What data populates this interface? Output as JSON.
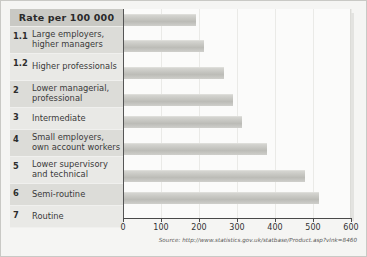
{
  "header": {
    "title": "Rate per 100 000"
  },
  "source": {
    "text": "Source: http://www.statistics.gov.uk/statbase/Product.asp?vlnk=8460"
  },
  "rows": [
    {
      "num": "1.1",
      "label": "Large employers, higher managers"
    },
    {
      "num": "1.2",
      "label": "Higher professionals"
    },
    {
      "num": "2",
      "label": "Lower managerial, professional"
    },
    {
      "num": "3",
      "label": "Intermediate"
    },
    {
      "num": "4",
      "label": "Small employers, own account workers"
    },
    {
      "num": "5",
      "label": "Lower supervisory and technical"
    },
    {
      "num": "6",
      "label": "Semi-routine"
    },
    {
      "num": "7",
      "label": "Routine"
    }
  ],
  "axis": {
    "ticks": [
      "0",
      "100",
      "200",
      "300",
      "400",
      "500",
      "600"
    ]
  },
  "colors": {
    "bar": "#c2c2bd",
    "header_band": "#c9c9c4",
    "row_odd": "#dcdcd8",
    "row_even": "#e9e9e6",
    "plot_bg": "#fbfbfa",
    "axis": "#4a4a4a"
  },
  "chart_data": {
    "type": "bar",
    "orientation": "horizontal",
    "title": "Rate per 100 000",
    "xlabel": "",
    "ylabel": "",
    "xlim": [
      0,
      600
    ],
    "grid": true,
    "legend": false,
    "categories": [
      "1.1 Large employers, higher managers",
      "1.2 Higher professionals",
      "2 Lower managerial, professional",
      "3 Intermediate",
      "4 Small employers, own account workers",
      "5 Lower supervisory and technical",
      "6 Semi-routine",
      "7 Routine"
    ],
    "values": [
      190,
      211,
      264,
      288,
      311,
      375,
      476,
      513
    ],
    "tick_labels": [
      "0",
      "100",
      "200",
      "300",
      "400",
      "500",
      "600"
    ],
    "annotations": [
      "Source: http://www.statistics.gov.uk/statbase/Product.asp?vlnk=8460"
    ]
  }
}
